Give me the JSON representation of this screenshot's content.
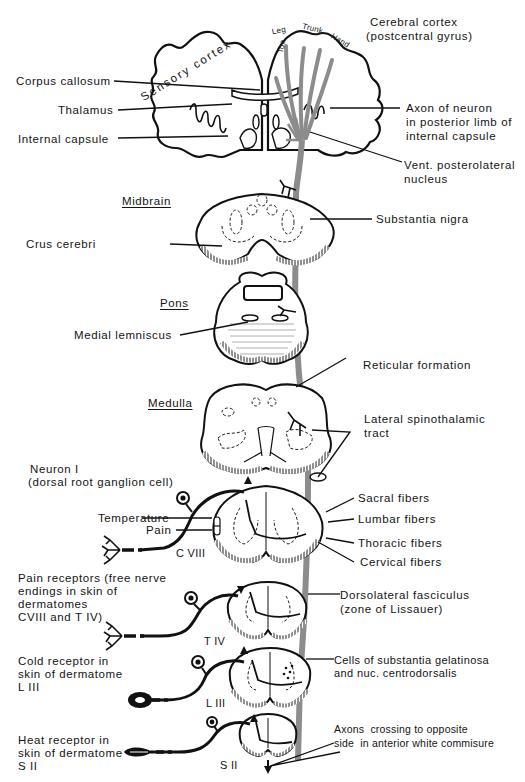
{
  "figure": {
    "title_regions": {
      "midbrain": "Midbrain",
      "pons": "Pons",
      "medulla": "Medulla"
    },
    "cortex": {
      "sensory_cortex": "Sensory cortex",
      "cerebral_cortex_line1": "Cerebral cortex",
      "cerebral_cortex_line2": "(postcentral gyrus)",
      "homunculus": [
        "Toe",
        "Leg",
        "Trunk",
        "Hand"
      ]
    },
    "left_labels": {
      "corpus_callosum": "Corpus callosum",
      "thalamus": "Thalamus",
      "internal_capsule": "Internal capsule",
      "crus_cerebri": "Crus cerebri",
      "medial_lemniscus": "Medial lemniscus",
      "neuron_line1": "Neuron I",
      "neuron_line2": "(dorsal root ganglion cell)",
      "temperature": "Temperature",
      "pain": "Pain",
      "pain_receptors": [
        "Pain receptors (free nerve",
        "endings in skin of",
        "dermatomes",
        "CVIII and T IV)"
      ],
      "cold_receptor": [
        "Cold receptor in",
        "skin of dermatome",
        "L III"
      ],
      "heat_receptor": [
        "Heat receptor in",
        "skin of dermatome",
        "S II"
      ]
    },
    "right_labels": {
      "axon_neuron": [
        "Axon of neuron",
        "in posterior limb of",
        "internal capsule"
      ],
      "vpl_nucleus": [
        "Vent. posterolateral",
        "nucleus"
      ],
      "substantia_nigra": "Substantia nigra",
      "reticular_formation": "Reticular formation",
      "lateral_spinothalamic": [
        "Lateral spinothalamic",
        "tract"
      ],
      "sacral_fibers": "Sacral fibers",
      "lumbar_fibers": "Lumbar fibers",
      "thoracic_fibers": "Thoracic fibers",
      "cervical_fibers": "Cervical fibers",
      "dorsolateral_fasciculus": [
        "Dorsolateral fasciculus",
        "(zone of Lissauer)"
      ],
      "substantia_gelatinosa": [
        "Cells of substantia gelatinosa",
        "and nuc. centrodorsalis"
      ],
      "axons_crossing": [
        "Axons  crossing to opposite",
        "side  in anterior white commisure"
      ]
    },
    "spinal_levels": {
      "c8": "C VIII",
      "t4": "T IV",
      "l3": "L III",
      "s2": "S II"
    },
    "colors": {
      "ink": "#141414",
      "tract_grey": "#8c8c8c",
      "background": "#ffffff"
    },
    "footer_text": "Fig. — Lateral spinothalamic tract: pain and temperature pathway from dermatomes to postcentral gyrus"
  }
}
